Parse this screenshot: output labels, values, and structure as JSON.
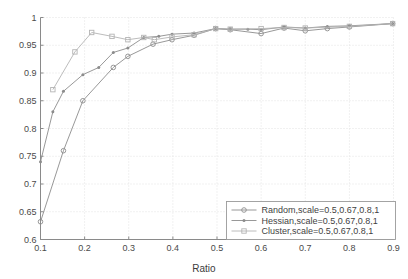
{
  "chart_data": {
    "type": "line",
    "title": "",
    "xlabel": "Ratio",
    "ylabel": "",
    "xlim": [
      0.1,
      0.9
    ],
    "ylim": [
      0.6,
      1.0
    ],
    "xticks": [
      0.1,
      0.2,
      0.3,
      0.4,
      0.5,
      0.6,
      0.7,
      0.8,
      0.9
    ],
    "xtick_labels": [
      "0.1",
      "0.2",
      "0.3",
      "0.4",
      "0.5",
      "0.6",
      "0.7",
      "0.8",
      "0.9"
    ],
    "yticks": [
      0.6,
      0.65,
      0.7,
      0.75,
      0.8,
      0.85,
      0.9,
      0.95,
      1.0
    ],
    "ytick_labels": [
      "0.6",
      "0.65",
      "0.7",
      "0.75",
      "0.8",
      "0.85",
      "0.9",
      "0.95",
      "1"
    ],
    "grid": true,
    "grid_style": "dotted",
    "legend_position": "lower right",
    "series": [
      {
        "name": "Random,scale=0.5,0.67,0.8,1",
        "marker": "circle",
        "color": "#8c8c8c",
        "x": [
          0.1,
          0.152,
          0.196,
          0.265,
          0.298,
          0.355,
          0.398,
          0.448,
          0.497,
          0.53,
          0.6,
          0.652,
          0.7,
          0.75,
          0.8,
          0.898
        ],
        "values": [
          0.632,
          0.76,
          0.85,
          0.91,
          0.93,
          0.952,
          0.96,
          0.968,
          0.98,
          0.978,
          0.971,
          0.981,
          0.976,
          0.98,
          0.983,
          0.989
        ]
      },
      {
        "name": "Hessian,scale=0.5,0.67,0.8,1",
        "marker": "star",
        "color": "#8c8c8c",
        "x": [
          0.1,
          0.128,
          0.152,
          0.196,
          0.232,
          0.265,
          0.298,
          0.334,
          0.368,
          0.398,
          0.448,
          0.497,
          0.53,
          0.57,
          0.6,
          0.652,
          0.7,
          0.75,
          0.8,
          0.898
        ],
        "values": [
          0.74,
          0.83,
          0.867,
          0.897,
          0.91,
          0.937,
          0.945,
          0.964,
          0.966,
          0.97,
          0.972,
          0.98,
          0.979,
          0.979,
          0.978,
          0.983,
          0.981,
          0.984,
          0.985,
          0.989
        ]
      },
      {
        "name": "Cluster,scale=0.5,0.67,0.8,1",
        "marker": "square",
        "color": "#b4b4b4",
        "x": [
          0.128,
          0.178,
          0.216,
          0.262,
          0.298,
          0.334,
          0.358,
          0.398,
          0.448,
          0.497,
          0.53,
          0.6,
          0.652,
          0.7,
          0.8,
          0.898
        ],
        "values": [
          0.87,
          0.938,
          0.973,
          0.966,
          0.96,
          0.964,
          0.96,
          0.965,
          0.969,
          0.98,
          0.979,
          0.98,
          0.982,
          0.981,
          0.984,
          0.989
        ]
      }
    ]
  },
  "legend": {
    "entries": [
      {
        "label": "Random,scale=0.5,0.67,0.8,1",
        "marker": "circle"
      },
      {
        "label": "Hessian,scale=0.5,0.67,0.8,1",
        "marker": "star"
      },
      {
        "label": "Cluster,scale=0.5,0.67,0.8,1",
        "marker": "square"
      }
    ]
  },
  "colors": {
    "axis": "#8a8a8a",
    "grid": "#e2e2e2",
    "text": "#3f3f3f",
    "series_random": "#8c8c8c",
    "series_hessian": "#8c8c8c",
    "series_cluster": "#b4b4b4",
    "background": "#ffffff"
  }
}
